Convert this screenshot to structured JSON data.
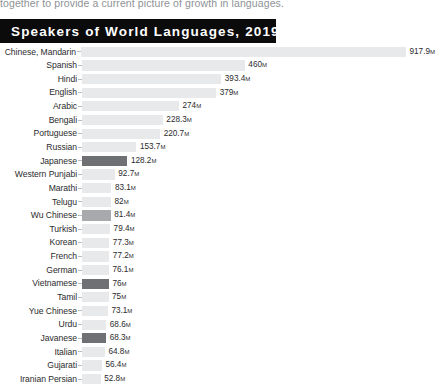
{
  "page_excerpt": "together to provide a current picture of growth in languages.",
  "title": "Speakers of World Languages, 2019",
  "chart_data": {
    "type": "bar",
    "title": "Speakers of World Languages, 2019",
    "xlabel": "",
    "ylabel": "",
    "orientation": "horizontal",
    "unit": "M",
    "unit_meaning": "millions of speakers",
    "xlim": [
      0,
      917.9
    ],
    "grid": false,
    "legend": "none",
    "value_label_position": "outside-end",
    "colors": {
      "bar_default": "#e8e9ea",
      "bar_highlight_dark": "#6e7073",
      "bar_highlight_medium": "#a7a9ac",
      "banner_background": "#0b0b0c",
      "banner_text": "#ffffff",
      "label_text": "#2b2b2d"
    },
    "categories": [
      "Chinese, Mandarin",
      "Spanish",
      "Hindi",
      "English",
      "Arabic",
      "Bengali",
      "Portuguese",
      "Russian",
      "Japanese",
      "Western Punjabi",
      "Marathi",
      "Telugu",
      "Wu Chinese",
      "Turkish",
      "Korean",
      "French",
      "German",
      "Vietnamese",
      "Tamil",
      "Yue Chinese",
      "Urdu",
      "Javanese",
      "Italian",
      "Gujarati",
      "Iranian Persian"
    ],
    "values": [
      917.9,
      460,
      393.4,
      379,
      274,
      228.3,
      220.7,
      153.7,
      128.2,
      92.7,
      83.1,
      82,
      81.4,
      79.4,
      77.3,
      77.2,
      76.1,
      76,
      75,
      73.1,
      68.6,
      68.3,
      64.8,
      56.4,
      52.8
    ],
    "value_labels": [
      "917.9",
      "460",
      "393.4",
      "379",
      "274",
      "228.3",
      "220.7",
      "153.7",
      "128.2",
      "92.7",
      "83.1",
      "82",
      "81.4",
      "79.4",
      "77.3",
      "77.2",
      "76.1",
      "76",
      "75",
      "73.1",
      "68.6",
      "68.3",
      "64.8",
      "56.4",
      "52.8"
    ],
    "highlights": [
      "none",
      "none",
      "none",
      "none",
      "none",
      "none",
      "none",
      "none",
      "dark",
      "none",
      "none",
      "none",
      "medium",
      "none",
      "none",
      "none",
      "none",
      "dark",
      "none",
      "none",
      "none",
      "dark",
      "none",
      "none",
      "none"
    ]
  }
}
